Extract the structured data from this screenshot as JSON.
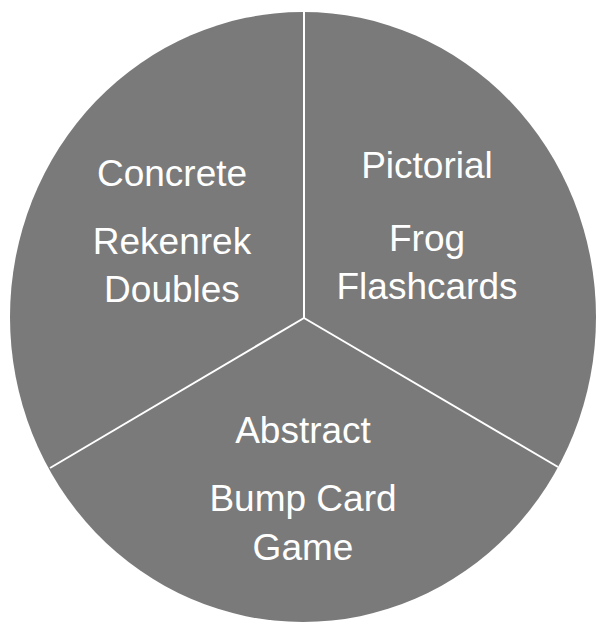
{
  "diagram": {
    "type": "three-part circle",
    "fill_color": "#7a7a7a",
    "divider_color": "#ffffff",
    "sections": [
      {
        "title": "Concrete",
        "activity_line1": "Rekenrek",
        "activity_line2": "Doubles"
      },
      {
        "title": "Pictorial",
        "activity_line1": "Frog",
        "activity_line2": "Flashcards"
      },
      {
        "title": "Abstract",
        "activity_line1": "Bump Card",
        "activity_line2": "Game"
      }
    ]
  }
}
